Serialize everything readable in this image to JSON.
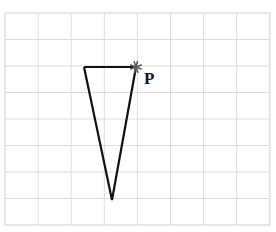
{
  "figure": {
    "background_color": "#ffffff",
    "width": 276,
    "height": 232
  },
  "grid": {
    "name": "square-grid",
    "line_color": "#dcdcdc",
    "line_color_outer": "#cfcfcf",
    "line_width": 1,
    "columns": 8,
    "rows": 8,
    "x_start": 5,
    "y_start": 13,
    "cell_width": 33.1,
    "cell_height": 26.5,
    "x_end": 270,
    "y_end": 225
  },
  "shape": {
    "name": "triangle",
    "type": "polygon",
    "stroke_color": "#111111",
    "stroke_width": 2.2,
    "fill": "none",
    "vertices": [
      {
        "label": "top-left",
        "x": 84,
        "y": 67
      },
      {
        "label": "top-right",
        "x": 136,
        "y": 67
      },
      {
        "label": "bottom",
        "x": 112,
        "y": 200
      }
    ]
  },
  "marker": {
    "name": "point-P-marker",
    "glyph": "asterisk-cross",
    "x": 136,
    "y": 67,
    "color": "#5a5a5f",
    "size": 11,
    "stroke_width": 1.6
  },
  "labels": {
    "point_p": {
      "text": "P",
      "x": 144,
      "y": 70,
      "color": "#15161a",
      "font_size": 17
    }
  }
}
